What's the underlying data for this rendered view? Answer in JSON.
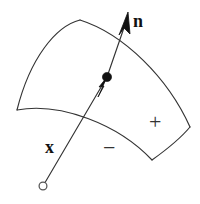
{
  "figure": {
    "background_color": "#ffffff",
    "stroke_color": "#333333",
    "ink_color": "#111111",
    "width": 200,
    "height": 204
  },
  "labels": {
    "normal_vector": "n",
    "position_vector": "x",
    "positive_side": "+",
    "negative_side": "−"
  },
  "geometry": {
    "surface_patch": {
      "name": "curved-quadrilateral-surface",
      "corners": {
        "top": [
          80,
          20
        ],
        "left": [
          17,
          110
        ],
        "bottom": [
          152,
          160
        ],
        "right": [
          190,
          127
        ]
      },
      "edges": [
        {
          "name": "top-left-edge",
          "from": [
            80,
            20
          ],
          "to": [
            17,
            110
          ],
          "curvature": "bulges-up-left"
        },
        {
          "name": "top-right-edge",
          "from": [
            80,
            20
          ],
          "to": [
            190,
            127
          ],
          "curvature": "bulges-up-right"
        },
        {
          "name": "bottom-left-edge",
          "from": [
            17,
            110
          ],
          "to": [
            152,
            160
          ],
          "curvature": "bulges-up"
        },
        {
          "name": "bottom-right-edge",
          "from": [
            152,
            160
          ],
          "to": [
            190,
            127
          ],
          "curvature": "slightly-bulges-out"
        }
      ]
    },
    "surface_point": {
      "name": "point-on-surface",
      "position": [
        107,
        77
      ],
      "radius": 4.5
    },
    "origin_point": {
      "name": "ray-origin",
      "position": [
        43,
        186
      ],
      "radius": 4,
      "style": "open-circle"
    },
    "position_vector_ray": {
      "name": "position-vector-x",
      "from": [
        43,
        186
      ],
      "to": [
        107,
        77
      ],
      "arrowhead_at": [
        104,
        84
      ]
    },
    "normal_vector": {
      "name": "normal-vector-n",
      "from": [
        107,
        77
      ],
      "to": [
        128,
        12
      ],
      "arrowhead_at": [
        128,
        12
      ]
    },
    "sign_positions": {
      "plus": [
        156,
        122
      ],
      "minus": [
        111,
        148
      ]
    }
  }
}
